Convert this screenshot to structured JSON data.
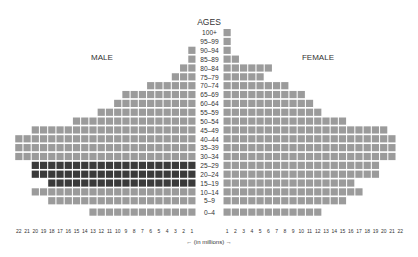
{
  "chart_data": {
    "type": "bar",
    "subtype": "population-pyramid-unit-squares",
    "title": "AGES",
    "left_label": "MALE",
    "right_label": "FEMALE",
    "xlabel": "← (in millions) →",
    "unit": "millions",
    "categories": [
      "100+",
      "95–99",
      "90–94",
      "85–89",
      "80–84",
      "75–79",
      "70–74",
      "65–69",
      "60–64",
      "55–59",
      "50–54",
      "45–49",
      "40–44",
      "35–39",
      "30–34",
      "25–29",
      "20–24",
      "15–19",
      "10–14",
      "5–9",
      "0–4"
    ],
    "series": [
      {
        "name": "Male",
        "values": [
          0,
          0,
          1,
          1,
          2,
          3,
          6,
          9,
          10,
          12,
          15,
          20,
          22,
          22,
          22,
          20,
          20,
          18,
          20,
          18,
          13
        ]
      },
      {
        "name": "Female",
        "values": [
          1,
          1,
          1,
          2,
          6,
          5,
          8,
          10,
          11,
          12,
          15,
          20,
          21,
          21,
          21,
          19,
          19,
          16,
          17,
          15,
          12
        ]
      }
    ],
    "highlighted_categories": {
      "Male": [
        "25–29",
        "20–24",
        "15–19"
      ]
    },
    "x_ticks_left": [
      "22",
      "21",
      "20",
      "19",
      "18",
      "17",
      "16",
      "15",
      "14",
      "13",
      "12",
      "11",
      "10",
      "9",
      "8",
      "7",
      "6",
      "5",
      "4",
      "3",
      "2",
      "1"
    ],
    "x_ticks_right": [
      "1",
      "2",
      "3",
      "4",
      "5",
      "6",
      "7",
      "8",
      "9",
      "10",
      "11",
      "12",
      "13",
      "14",
      "15",
      "16",
      "17",
      "18",
      "19",
      "20",
      "21",
      "22"
    ],
    "xlim": [
      0,
      22
    ],
    "colors": {
      "default": "#9b9b9b",
      "highlight": "#3a3a3a"
    }
  }
}
